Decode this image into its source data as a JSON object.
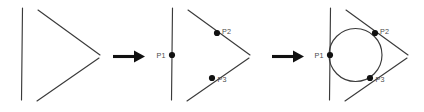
{
  "figure": {
    "background_color": "#ffffff",
    "line_color": "#3a3a3a",
    "dot_color": "#111111",
    "label_color": "#4a4a4a",
    "arrow_color": "#101010",
    "width": 424,
    "height": 112
  },
  "panels": [
    {
      "id": "panel-1",
      "name": "three-lines",
      "lines": [
        {
          "name": "vertical-line",
          "x1": 22.5,
          "y1": 8,
          "x2": 21.5,
          "y2": 100
        },
        {
          "name": "upper-diagonal-line",
          "x1": 38,
          "y1": 10,
          "x2": 100,
          "y2": 55
        },
        {
          "name": "lower-diagonal-line",
          "x1": 37,
          "y1": 101,
          "x2": 99,
          "y2": 58
        }
      ],
      "points": [],
      "circle": null
    },
    {
      "id": "panel-2",
      "name": "three-lines-with-tangent-points",
      "lines": [
        {
          "name": "vertical-line",
          "x1": 172.5,
          "y1": 8,
          "x2": 171.5,
          "y2": 100
        },
        {
          "name": "upper-diagonal-line",
          "x1": 188,
          "y1": 10,
          "x2": 250,
          "y2": 55
        },
        {
          "name": "lower-diagonal-line",
          "x1": 187,
          "y1": 101,
          "x2": 249,
          "y2": 58
        }
      ],
      "points": [
        {
          "name": "point-p1",
          "label": "P1",
          "cx": 172,
          "cy": 55,
          "r": 3.1,
          "label_x": 156.5,
          "label_y": 57.5,
          "anchor": "start"
        },
        {
          "name": "point-p2",
          "label": "P2",
          "cx": 217,
          "cy": 33,
          "r": 3.1,
          "label_x": 222,
          "label_y": 33.5,
          "anchor": "start"
        },
        {
          "name": "point-p3",
          "label": "P3",
          "cx": 212,
          "cy": 78,
          "r": 3.1,
          "label_x": 217.5,
          "label_y": 82,
          "anchor": "start"
        }
      ],
      "circle": null
    },
    {
      "id": "panel-3",
      "name": "three-lines-with-inscribed-circle",
      "lines": [
        {
          "name": "vertical-line",
          "x1": 330.5,
          "y1": 8,
          "x2": 329.5,
          "y2": 100
        },
        {
          "name": "upper-diagonal-line",
          "x1": 346,
          "y1": 10,
          "x2": 408,
          "y2": 55
        },
        {
          "name": "lower-diagonal-line",
          "x1": 345,
          "y1": 101,
          "x2": 407,
          "y2": 58
        }
      ],
      "points": [
        {
          "name": "point-p1",
          "label": "P1",
          "cx": 330,
          "cy": 55,
          "r": 3.1,
          "label_x": 314.5,
          "label_y": 57.5,
          "anchor": "start"
        },
        {
          "name": "point-p2",
          "label": "P2",
          "cx": 375,
          "cy": 33,
          "r": 3.1,
          "label_x": 380,
          "label_y": 33.5,
          "anchor": "start"
        },
        {
          "name": "point-p3",
          "label": "P3",
          "cx": 370,
          "cy": 78,
          "r": 3.1,
          "label_x": 375.5,
          "label_y": 82,
          "anchor": "start"
        }
      ],
      "circle": {
        "name": "tangent-circle",
        "cx": 355.5,
        "cy": 55,
        "r": 26.5
      }
    }
  ],
  "arrows": [
    {
      "name": "arrow-1",
      "x1": 113,
      "y1": 56.5,
      "x2": 134,
      "y2": 56.5,
      "head": "134,50.5 145,56.5 134,62.5"
    },
    {
      "name": "arrow-2",
      "x1": 272,
      "y1": 56.5,
      "x2": 293,
      "y2": 56.5,
      "head": "293,50.5 304,56.5 293,62.5"
    }
  ]
}
